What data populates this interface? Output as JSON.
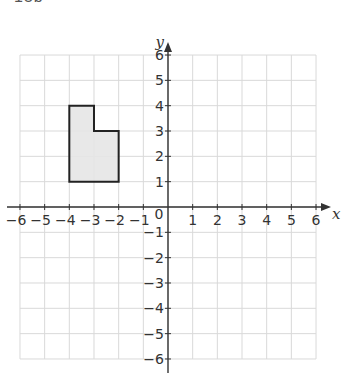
{
  "header": {
    "cut_text": "15b"
  },
  "colors": {
    "grid": "#d9d9d9",
    "axis": "#333333",
    "shape_fill": "#e6e6e6",
    "shape_stroke": "#222222"
  },
  "chart_data": {
    "type": "scatter",
    "title": "",
    "xlabel": "x",
    "ylabel": "y",
    "xlim": [
      -6,
      6
    ],
    "ylim": [
      -6,
      6
    ],
    "grid": true,
    "x_ticks": [
      -6,
      -5,
      -4,
      -3,
      -2,
      -1,
      1,
      2,
      3,
      4,
      5,
      6
    ],
    "y_ticks": [
      -6,
      -5,
      -4,
      -3,
      -2,
      -1,
      1,
      2,
      3,
      4,
      5,
      6
    ],
    "x_tick_labels": [
      "−6",
      "−5",
      "−4",
      "−3",
      "−2",
      "−1",
      "1",
      "2",
      "3",
      "4",
      "5",
      "6"
    ],
    "y_tick_labels": [
      "−6",
      "−5",
      "−4",
      "−3",
      "−2",
      "−1",
      "1",
      "2",
      "3",
      "4",
      "5",
      "6"
    ],
    "origin_label": "0",
    "shapes": [
      {
        "name": "shaded polygon",
        "vertices": [
          [
            -4,
            4
          ],
          [
            -3,
            4
          ],
          [
            -3,
            3
          ],
          [
            -2,
            3
          ],
          [
            -2,
            1
          ],
          [
            -4,
            1
          ]
        ]
      }
    ]
  }
}
